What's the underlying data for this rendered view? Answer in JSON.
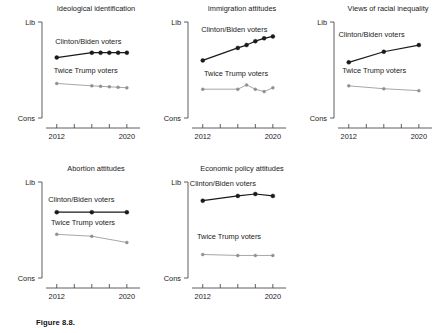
{
  "figure": {
    "caption": "Figure 8.8.",
    "y_axis_top_label": "Lib",
    "y_axis_bottom_label": "Cons",
    "x_tick_labels": [
      "2012",
      "2020"
    ],
    "series_names": {
      "democrat": "Clinton/Biden voters",
      "republican": "Twice Trump voters"
    },
    "colors": {
      "democrat": "#1a1a1a",
      "republican": "#8f8f8f",
      "axis": "#4d4d4d",
      "text": "#1a1a1a",
      "background": "#ffffff"
    }
  },
  "chart_data": [
    {
      "type": "line",
      "title": "Ideological identification",
      "xlabel": "",
      "ylabel": "",
      "ylim": [
        0,
        1
      ],
      "xlim": [
        2011.0,
        2021.5
      ],
      "ytick_labels": [
        "Cons",
        "Lib"
      ],
      "xtick_values": [
        2012,
        2014,
        2016,
        2018,
        2020
      ],
      "xtick_labels": [
        "2012",
        "",
        "",
        "",
        "2020"
      ],
      "grid": false,
      "legend": "inline-annotation",
      "series": [
        {
          "name": "Clinton/Biden voters",
          "color": "#1a1a1a",
          "x": [
            2012,
            2016,
            2017,
            2018,
            2019,
            2020
          ],
          "values": [
            0.63,
            0.68,
            0.68,
            0.68,
            0.68,
            0.68
          ],
          "label_x": 2015.6,
          "label_y": 0.8
        },
        {
          "name": "Twice Trump voters",
          "color": "#8f8f8f",
          "x": [
            2012,
            2016,
            2017,
            2018,
            2019,
            2020
          ],
          "values": [
            0.36,
            0.335,
            0.33,
            0.325,
            0.32,
            0.315
          ],
          "label_x": 2015.3,
          "label_y": 0.5
        }
      ]
    },
    {
      "type": "line",
      "title": "Immigration attitudes",
      "xlabel": "",
      "ylabel": "",
      "ylim": [
        0,
        1
      ],
      "xlim": [
        2011.0,
        2021.5
      ],
      "ytick_labels": [
        "Cons",
        "Lib"
      ],
      "xtick_values": [
        2012,
        2014,
        2016,
        2018,
        2020
      ],
      "xtick_labels": [
        "2012",
        "",
        "",
        "",
        "2020"
      ],
      "grid": false,
      "legend": "inline-annotation",
      "series": [
        {
          "name": "Clinton/Biden voters",
          "color": "#1a1a1a",
          "x": [
            2012,
            2016,
            2017,
            2018,
            2019,
            2020
          ],
          "values": [
            0.6,
            0.73,
            0.76,
            0.8,
            0.83,
            0.85
          ],
          "label_x": 2015.6,
          "label_y": 0.93
        },
        {
          "name": "Twice Trump voters",
          "color": "#8f8f8f",
          "x": [
            2012,
            2016,
            2017,
            2018,
            2019,
            2020
          ],
          "values": [
            0.3,
            0.3,
            0.345,
            0.3,
            0.275,
            0.315
          ],
          "label_x": 2015.8,
          "label_y": 0.47
        }
      ]
    },
    {
      "type": "line",
      "title": "Views of racial inequality",
      "xlabel": "",
      "ylabel": "",
      "ylim": [
        0,
        1
      ],
      "xlim": [
        2011.0,
        2021.5
      ],
      "ytick_labels": [
        "Cons",
        "Lib"
      ],
      "xtick_values": [
        2012,
        2014,
        2016,
        2018,
        2020
      ],
      "xtick_labels": [
        "2012",
        "",
        "",
        "",
        "2020"
      ],
      "grid": false,
      "legend": "inline-annotation",
      "series": [
        {
          "name": "Clinton/Biden voters",
          "color": "#1a1a1a",
          "x": [
            2012,
            2016,
            2020
          ],
          "values": [
            0.58,
            0.69,
            0.76
          ],
          "label_x": 2014.6,
          "label_y": 0.88
        },
        {
          "name": "Twice Trump voters",
          "color": "#8f8f8f",
          "x": [
            2012,
            2016,
            2020
          ],
          "values": [
            0.335,
            0.305,
            0.285
          ],
          "label_x": 2014.9,
          "label_y": 0.5
        }
      ]
    },
    {
      "type": "line",
      "title": "Abortion attitudes",
      "xlabel": "",
      "ylabel": "",
      "ylim": [
        0,
        1
      ],
      "xlim": [
        2011.0,
        2021.5
      ],
      "ytick_labels": [
        "Cons",
        "Lib"
      ],
      "xtick_values": [
        2012,
        2014,
        2016,
        2018,
        2020
      ],
      "xtick_labels": [
        "2012",
        "",
        "",
        "",
        "2020"
      ],
      "grid": false,
      "legend": "inline-annotation",
      "series": [
        {
          "name": "Clinton/Biden voters",
          "color": "#1a1a1a",
          "x": [
            2012,
            2016,
            2020
          ],
          "values": [
            0.685,
            0.685,
            0.685
          ],
          "label_x": 2014.8,
          "label_y": 0.82
        },
        {
          "name": "Twice Trump voters",
          "color": "#8f8f8f",
          "x": [
            2012,
            2016,
            2020
          ],
          "values": [
            0.455,
            0.435,
            0.37
          ],
          "label_x": 2015.0,
          "label_y": 0.58
        }
      ]
    },
    {
      "type": "line",
      "title": "Economic policy attitudes",
      "xlabel": "",
      "ylabel": "",
      "ylim": [
        0,
        1
      ],
      "xlim": [
        2011.0,
        2021.5
      ],
      "ytick_labels": [
        "Cons",
        "Lib"
      ],
      "xtick_values": [
        2012,
        2014,
        2016,
        2018,
        2020
      ],
      "xtick_labels": [
        "2012",
        "",
        "",
        "",
        "2020"
      ],
      "grid": false,
      "legend": "inline-annotation",
      "series": [
        {
          "name": "Clinton/Biden voters",
          "color": "#1a1a1a",
          "x": [
            2012,
            2016,
            2018,
            2020
          ],
          "values": [
            0.805,
            0.855,
            0.875,
            0.855
          ],
          "label_x": 2014.3,
          "label_y": 0.99
        },
        {
          "name": "Twice Trump voters",
          "color": "#8f8f8f",
          "x": [
            2012,
            2016,
            2018,
            2020
          ],
          "values": [
            0.245,
            0.235,
            0.235,
            0.235
          ],
          "label_x": 2015.0,
          "label_y": 0.44
        }
      ]
    }
  ]
}
